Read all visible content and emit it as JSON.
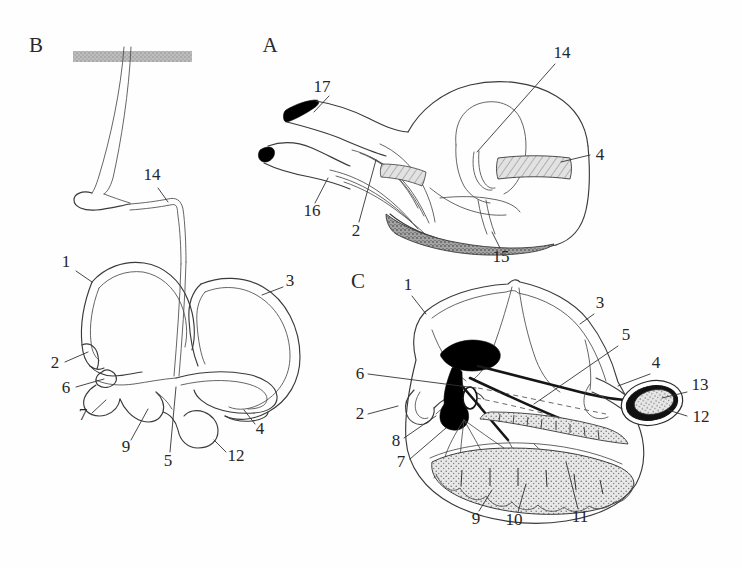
{
  "figure": {
    "background_color": "#ffffff",
    "ink_color": "#2a2a2a",
    "width": 742,
    "height": 568
  },
  "panels": [
    {
      "id": "A",
      "letter": "A",
      "letter_x": 268,
      "letter_y": 52,
      "description": "Lateral view of the utricle, saccule and associated canals with sensory epithelium",
      "callouts": [
        {
          "num": "17",
          "x": 320,
          "y": 88,
          "lx1": 334,
          "ly1": 93,
          "lx2": 352,
          "ly2": 112
        },
        {
          "num": "16",
          "x": 310,
          "y": 212,
          "lx1": 317,
          "ly1": 203,
          "lx2": 330,
          "ly2": 180
        },
        {
          "num": "2",
          "x": 355,
          "y": 232,
          "lx1": 360,
          "ly1": 222,
          "lx2": 374,
          "ly2": 162
        },
        {
          "num": "15",
          "x": 498,
          "y": 258,
          "lx1": 500,
          "ly1": 247,
          "lx2": 492,
          "ly2": 232
        },
        {
          "num": "14",
          "x": 560,
          "y": 55,
          "lx1": 556,
          "ly1": 62,
          "lx2": 477,
          "ly2": 152
        },
        {
          "num": "4",
          "x": 596,
          "y": 157,
          "lx1": 590,
          "ly1": 153,
          "lx2": 562,
          "ly2": 152
        }
      ]
    },
    {
      "id": "B",
      "letter": "B",
      "letter_x": 36,
      "letter_y": 52,
      "description": "Whole membranous labyrinth with endolymphatic duct passing through bone",
      "callouts": [
        {
          "num": "14",
          "x": 152,
          "y": 180,
          "lx1": 158,
          "ly1": 188,
          "lx2": 168,
          "ly2": 202
        },
        {
          "num": "1",
          "x": 66,
          "y": 267,
          "lx1": 76,
          "ly1": 271,
          "lx2": 92,
          "ly2": 282
        },
        {
          "num": "3",
          "x": 288,
          "y": 281,
          "lx1": 283,
          "ly1": 287,
          "lx2": 262,
          "ly2": 295
        },
        {
          "num": "2",
          "x": 55,
          "y": 366,
          "lx1": 65,
          "ly1": 362,
          "lx2": 88,
          "ly2": 354
        },
        {
          "num": "6",
          "x": 66,
          "y": 391,
          "lx1": 76,
          "ly1": 387,
          "lx2": 106,
          "ly2": 378
        },
        {
          "num": "7",
          "x": 83,
          "y": 416,
          "lx1": 92,
          "ly1": 411,
          "lx2": 106,
          "ly2": 400
        },
        {
          "num": "9",
          "x": 124,
          "y": 447,
          "lx1": 129,
          "ly1": 438,
          "lx2": 146,
          "ly2": 410
        },
        {
          "num": "5",
          "x": 165,
          "y": 462,
          "lx1": 168,
          "ly1": 452,
          "lx2": 174,
          "ly2": 387
        },
        {
          "num": "12",
          "x": 229,
          "y": 459,
          "lx1": 226,
          "ly1": 451,
          "lx2": 213,
          "ly2": 438
        },
        {
          "num": "4",
          "x": 257,
          "y": 430,
          "lx1": 254,
          "ly1": 422,
          "lx2": 244,
          "ly2": 408
        }
      ]
    },
    {
      "id": "C",
      "letter": "C",
      "letter_x": 356,
      "letter_y": 288,
      "description": "Sectioned labyrinth showing innervation, maculae and cristae",
      "callouts": [
        {
          "num": "1",
          "x": 408,
          "y": 290,
          "lx1": 414,
          "ly1": 296,
          "lx2": 425,
          "ly2": 312
        },
        {
          "num": "3",
          "x": 598,
          "y": 308,
          "lx1": 594,
          "ly1": 313,
          "lx2": 580,
          "ly2": 322
        },
        {
          "num": "5",
          "x": 626,
          "y": 339,
          "lx1": 621,
          "ly1": 344,
          "lx2": 534,
          "ly2": 404
        },
        {
          "num": "6",
          "x": 358,
          "y": 373,
          "lx1": 369,
          "ly1": 374,
          "lx2": 434,
          "ly2": 385
        },
        {
          "num": "4",
          "x": 655,
          "y": 368,
          "lx1": 650,
          "ly1": 372,
          "lx2": 620,
          "ly2": 384
        },
        {
          "num": "13",
          "x": 693,
          "y": 389,
          "lx1": 688,
          "ly1": 392,
          "lx2": 660,
          "ly2": 397
        },
        {
          "num": "12",
          "x": 694,
          "y": 417,
          "lx1": 689,
          "ly1": 414,
          "lx2": 668,
          "ly2": 408
        },
        {
          "num": "2",
          "x": 358,
          "y": 414,
          "lx1": 369,
          "ly1": 413,
          "lx2": 395,
          "ly2": 408
        },
        {
          "num": "8",
          "x": 395,
          "y": 442,
          "lx1": 404,
          "ly1": 438,
          "lx2": 432,
          "ly2": 418
        },
        {
          "num": "7",
          "x": 400,
          "y": 461,
          "lx1": 409,
          "ly1": 457,
          "lx2": 438,
          "ly2": 430
        },
        {
          "num": "9",
          "x": 476,
          "y": 519,
          "lx1": 478,
          "ly1": 510,
          "lx2": 492,
          "ly2": 492
        },
        {
          "num": "10",
          "x": 513,
          "y": 520,
          "lx1": 517,
          "ly1": 511,
          "lx2": 525,
          "ly2": 486
        },
        {
          "num": "11",
          "x": 578,
          "y": 517,
          "lx1": 578,
          "ly1": 508,
          "lx2": 567,
          "ly2": 464
        }
      ]
    }
  ],
  "legend_keys": [
    {
      "num": "1",
      "name": "anterior-semicircular-canal"
    },
    {
      "num": "2",
      "name": "anterior-ampulla"
    },
    {
      "num": "3",
      "name": "posterior-semicircular-canal"
    },
    {
      "num": "4",
      "name": "lateral-canal-ampulla"
    },
    {
      "num": "5",
      "name": "utriculosaccular-duct"
    },
    {
      "num": "6",
      "name": "utricular-macula"
    },
    {
      "num": "7",
      "name": "lagenar-macula"
    },
    {
      "num": "8",
      "name": "vestibular-ganglion"
    },
    {
      "num": "9",
      "name": "sacculus"
    },
    {
      "num": "10",
      "name": "macula-neglecta"
    },
    {
      "num": "11",
      "name": "basilar-papilla"
    },
    {
      "num": "12",
      "name": "posterior-ampulla"
    },
    {
      "num": "13",
      "name": "crista-of-posterior-ampulla"
    },
    {
      "num": "14",
      "name": "endolymphatic-duct"
    },
    {
      "num": "15",
      "name": "otoconial-mass"
    },
    {
      "num": "16",
      "name": "cochlear-nerve-branch"
    },
    {
      "num": "17",
      "name": "nerve-root"
    }
  ],
  "shading": {
    "hatched_bar_label": "bone-cross-section-bar",
    "stipple_label": "otoconial-stipple",
    "dark_label": "neural-tissue-dark"
  }
}
